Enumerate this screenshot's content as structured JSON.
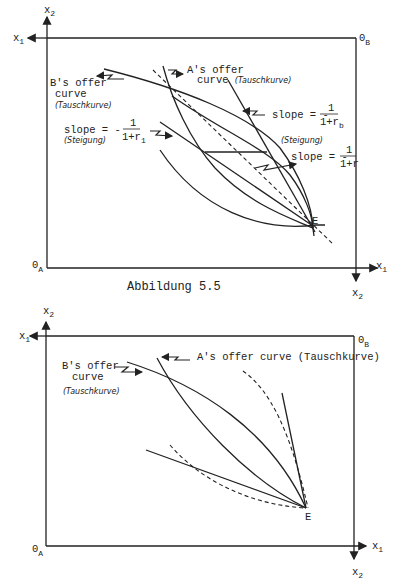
{
  "figure1": {
    "caption": "Abbildung 5.5",
    "axes": {
      "x1_top_left": "x",
      "x1_sub": "1",
      "x2_top": "x",
      "x2_sub": "2",
      "origin_A": "0",
      "origin_A_sub": "A",
      "origin_B": "0",
      "origin_B_sub": "B",
      "x1_bottom_right": "x",
      "x2_bottom_right": "x"
    },
    "labels": {
      "b_offer_line1": "B's offer",
      "b_offer_line2": "curve",
      "b_offer_de": "(Tauschkurve)",
      "a_offer_line1": "A's offer",
      "a_offer_line2": "curve (Tauschkurve)",
      "slope_prefix": "slope = -",
      "slope_num": "1",
      "slope_r1_den": "1+r",
      "slope_r1_sub": "1",
      "slope_rb_den": "1+r",
      "slope_rb_sub": "b",
      "slope_r_den": "1+r",
      "steigung": "(Steigung)",
      "point_E": "E"
    }
  },
  "figure2": {
    "axes": {
      "x1_top_left": "x",
      "x1_sub": "1",
      "x2_top": "x",
      "x2_sub": "2",
      "origin_A": "0",
      "origin_A_sub": "A",
      "origin_B": "0",
      "origin_B_sub": "B",
      "x1_bottom_right": "x",
      "x2_bottom_right": "x"
    },
    "labels": {
      "b_offer_line1": "B's offer",
      "b_offer_line2": "curve",
      "b_offer_de": "(Tauschkurve)",
      "a_offer": "A's offer curve (Tauschkurve)",
      "point_E": "E"
    }
  }
}
